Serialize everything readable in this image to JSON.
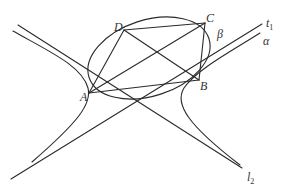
{
  "diagram": {
    "type": "geometry",
    "colors": {
      "stroke": "#2a2a2a",
      "label": "#333333",
      "background": "#ffffff"
    },
    "points": {
      "A": {
        "label": "A",
        "x": 89,
        "y": 93
      },
      "B": {
        "label": "B",
        "x": 199,
        "y": 80
      },
      "C": {
        "label": "C",
        "x": 205,
        "y": 23
      },
      "D": {
        "label": "D",
        "x": 124,
        "y": 30
      }
    },
    "labels": {
      "A": "A",
      "B": "B",
      "C": "C",
      "D": "D",
      "beta": "β",
      "alpha": "α",
      "t1_main": "t",
      "t1_sub": "1",
      "l2_main": "l",
      "l2_sub": "2"
    },
    "curves": {
      "ellipse": {
        "cx": 149,
        "cy": 58,
        "rx": 63,
        "ry": 38,
        "rotation": -18
      },
      "hyperbola_left": "branch with vertex near A",
      "hyperbola_right": "branch with vertex near B",
      "asymptote_t1": "line from lower-left to upper-right",
      "asymptote_l2": "line from upper-left to lower-right"
    },
    "segments": [
      "AD",
      "DC",
      "AC",
      "AB",
      "DB",
      "CB"
    ]
  }
}
